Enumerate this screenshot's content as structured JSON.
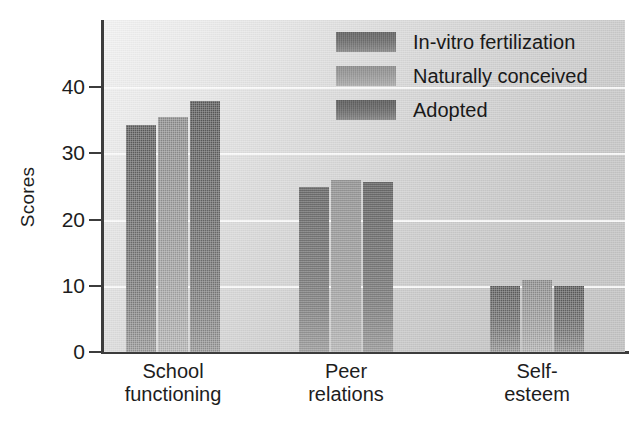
{
  "chart_data": {
    "type": "bar",
    "title": "",
    "xlabel": "",
    "ylabel": "Scores",
    "categories": [
      "School functioning",
      "Peer relations",
      "Self-esteem"
    ],
    "category_lines": [
      [
        "School",
        "functioning"
      ],
      [
        "Peer",
        "relations"
      ],
      [
        "Self-",
        "esteem"
      ]
    ],
    "series": [
      {
        "name": "In-vitro fertilization",
        "color": "#6e6e6e",
        "values": [
          34.2,
          24.9,
          10.0
        ]
      },
      {
        "name": "Naturally conceived",
        "color": "#9a9a9a",
        "values": [
          35.4,
          25.9,
          10.9
        ]
      },
      {
        "name": "Adopted",
        "color": "#6a6a6a",
        "values": [
          37.9,
          25.6,
          9.9
        ]
      }
    ],
    "ylim": [
      0,
      48
    ],
    "yticks": [
      0,
      10,
      20,
      30,
      40
    ],
    "ytick_labels": [
      "0",
      "10",
      "20",
      "30",
      "40"
    ],
    "grid": true,
    "gridline_color": "#fbfbfb",
    "legend_position": "top-right",
    "plot_background": "#d2d2d2",
    "axis_color": "#3c3c3c"
  },
  "legend": {
    "entries": [
      {
        "label": "In-vitro fertilization"
      },
      {
        "label": "Naturally conceived"
      },
      {
        "label": "Adopted"
      }
    ]
  },
  "axes": {
    "y_title": "Scores"
  }
}
